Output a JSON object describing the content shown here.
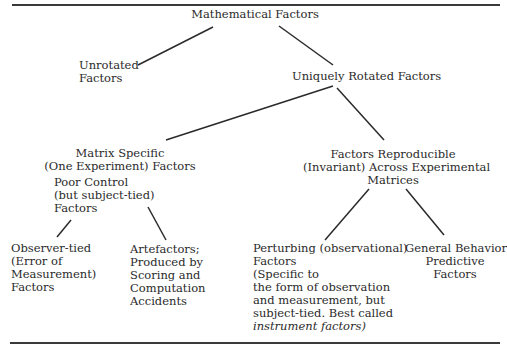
{
  "diagram": {
    "type": "hierarchy-tree",
    "nodes": {
      "root": {
        "lines": [
          "Mathematical Factors"
        ]
      },
      "unrotated": {
        "lines": [
          "Unrotated",
          "Factors"
        ]
      },
      "rotated": {
        "lines": [
          "Uniquely Rotated Factors"
        ]
      },
      "matrix_specific": {
        "lines": [
          "Matrix Specific",
          "(One Experiment) Factors"
        ]
      },
      "poor_control": {
        "lines": [
          "Poor Control",
          "(but subject-tied)",
          "Factors"
        ]
      },
      "reproducible": {
        "lines": [
          "Factors Reproducible",
          "(Invariant) Across Experimental",
          "Matrices"
        ]
      },
      "observer_tied": {
        "lines": [
          "Observer-tied",
          "(Error of",
          "Measurement)",
          "Factors"
        ]
      },
      "artefactors": {
        "lines": [
          "Artefactors;",
          "Produced by",
          "Scoring and",
          "Computation",
          "Accidents"
        ]
      },
      "perturbing": {
        "lines": [
          "Perturbing (observational)",
          "Factors",
          "(Specific to",
          "the form of observation",
          "and measurement, but",
          "subject-tied. Best called",
          "instrument factors)"
        ]
      },
      "general_behavior": {
        "lines": [
          "General Behavior",
          "Predictive",
          "Factors"
        ]
      }
    },
    "edges": [
      {
        "from": "root",
        "to": "unrotated"
      },
      {
        "from": "root",
        "to": "rotated"
      },
      {
        "from": "rotated",
        "to": "matrix_specific"
      },
      {
        "from": "rotated",
        "to": "reproducible"
      },
      {
        "from": "poor_control",
        "to": "observer_tied"
      },
      {
        "from": "poor_control",
        "to": "artefactors"
      },
      {
        "from": "reproducible",
        "to": "perturbing"
      },
      {
        "from": "reproducible",
        "to": "general_behavior"
      }
    ]
  }
}
